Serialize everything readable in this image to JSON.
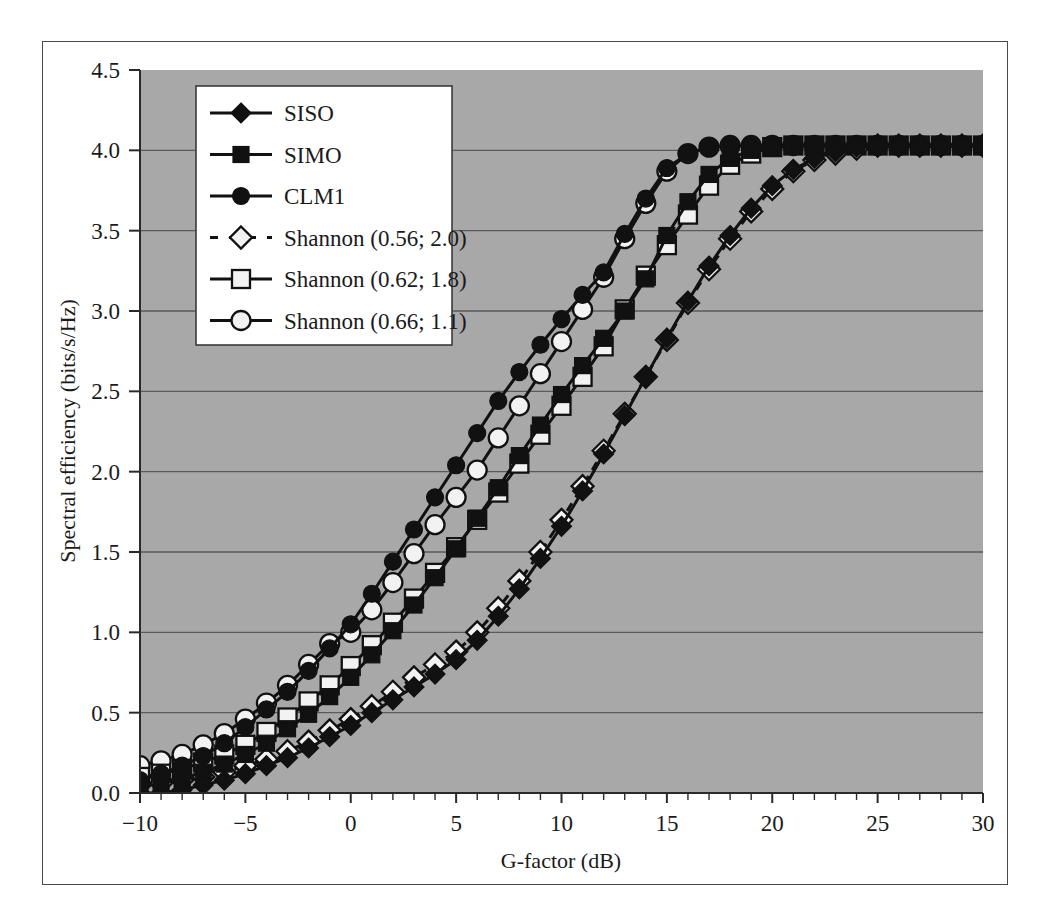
{
  "figure": {
    "background_color": "#ffffff",
    "frame_color": "#4a4a4a",
    "plot_background_color": "#a8a8a8",
    "grid_color": "#5a5a5a",
    "series_color": "#111111"
  },
  "chart_data": {
    "type": "line",
    "title": "",
    "xlabel": "G-factor (dB)",
    "ylabel": "Spectral efficiency (bits/s/Hz)",
    "xlim": [
      -10,
      30
    ],
    "ylim": [
      0.0,
      4.5
    ],
    "xticks": [
      -10,
      -5,
      0,
      5,
      10,
      15,
      20,
      25,
      30
    ],
    "xtick_labels": [
      "−10",
      "−5",
      "0",
      "5",
      "10",
      "15",
      "20",
      "25",
      "30"
    ],
    "xminor_tick_step": 1,
    "yticks": [
      0.0,
      0.5,
      1.0,
      1.5,
      2.0,
      2.5,
      3.0,
      3.5,
      4.0,
      4.5
    ],
    "ytick_labels": [
      "0.0",
      "0.5",
      "1.0",
      "1.5",
      "2.0",
      "2.5",
      "3.0",
      "3.5",
      "4.0",
      "4.5"
    ],
    "grid": "horizontal",
    "legend_position": "upper-left-inside",
    "x": [
      -10,
      -9,
      -8,
      -7,
      -6,
      -5,
      -4,
      -3,
      -2,
      -1,
      0,
      1,
      2,
      3,
      4,
      5,
      6,
      7,
      8,
      9,
      10,
      11,
      12,
      13,
      14,
      15,
      16,
      17,
      18,
      19,
      20,
      21,
      22,
      23,
      24,
      25,
      26,
      27,
      28,
      29,
      30
    ],
    "series": [
      {
        "name": "SISO",
        "marker": "filled-diamond",
        "linestyle": "solid",
        "values": [
          0.0,
          0.0,
          0.02,
          0.05,
          0.08,
          0.12,
          0.17,
          0.22,
          0.28,
          0.35,
          0.42,
          0.5,
          0.58,
          0.66,
          0.74,
          0.83,
          0.95,
          1.1,
          1.27,
          1.46,
          1.66,
          1.88,
          2.11,
          2.35,
          2.59,
          2.83,
          3.06,
          3.28,
          3.47,
          3.64,
          3.78,
          3.88,
          3.95,
          3.99,
          4.02,
          4.03,
          4.03,
          4.03,
          4.03,
          4.03,
          4.03
        ]
      },
      {
        "name": "SIMO",
        "marker": "filled-square",
        "linestyle": "solid",
        "values": [
          0.04,
          0.06,
          0.09,
          0.13,
          0.18,
          0.24,
          0.31,
          0.4,
          0.49,
          0.6,
          0.72,
          0.86,
          1.01,
          1.17,
          1.34,
          1.52,
          1.71,
          1.9,
          2.1,
          2.29,
          2.48,
          2.66,
          2.83,
          3.0,
          3.2,
          3.47,
          3.68,
          3.85,
          3.95,
          4.0,
          4.02,
          4.03,
          4.03,
          4.03,
          4.03,
          4.03,
          4.03,
          4.03,
          4.03,
          4.03,
          4.03
        ]
      },
      {
        "name": "CLM1",
        "marker": "filled-circle",
        "linestyle": "solid",
        "values": [
          0.08,
          0.12,
          0.17,
          0.23,
          0.31,
          0.41,
          0.52,
          0.63,
          0.76,
          0.9,
          1.05,
          1.24,
          1.44,
          1.64,
          1.84,
          2.04,
          2.24,
          2.44,
          2.62,
          2.79,
          2.95,
          3.1,
          3.24,
          3.48,
          3.7,
          3.89,
          3.98,
          4.02,
          4.03,
          4.03,
          4.03,
          4.03,
          4.03,
          4.03,
          4.03,
          4.03,
          4.03,
          4.03,
          4.03,
          4.03,
          4.03
        ]
      },
      {
        "name": "Shannon (0.56; 2.0)",
        "marker": "open-diamond",
        "linestyle": "dashed",
        "values": [
          0.05,
          0.06,
          0.08,
          0.1,
          0.13,
          0.17,
          0.21,
          0.26,
          0.32,
          0.39,
          0.46,
          0.54,
          0.63,
          0.72,
          0.8,
          0.88,
          1.0,
          1.15,
          1.32,
          1.5,
          1.7,
          1.91,
          2.13,
          2.36,
          2.59,
          2.82,
          3.05,
          3.26,
          3.45,
          3.62,
          3.76,
          3.87,
          3.94,
          3.98,
          4.01,
          4.03,
          4.03,
          4.03,
          4.03,
          4.03,
          4.03
        ]
      },
      {
        "name": "Shannon (0.62; 1.8)",
        "marker": "open-square",
        "linestyle": "solid",
        "values": [
          0.1,
          0.12,
          0.15,
          0.19,
          0.24,
          0.3,
          0.38,
          0.47,
          0.57,
          0.67,
          0.79,
          0.92,
          1.06,
          1.21,
          1.37,
          1.53,
          1.7,
          1.87,
          2.05,
          2.23,
          2.41,
          2.59,
          2.78,
          3.01,
          3.22,
          3.41,
          3.6,
          3.78,
          3.91,
          3.98,
          4.02,
          4.03,
          4.03,
          4.03,
          4.03,
          4.03,
          4.03,
          4.03,
          4.03,
          4.03,
          4.03
        ]
      },
      {
        "name": "Shannon (0.66; 1.1)",
        "marker": "open-circle",
        "linestyle": "solid",
        "values": [
          0.17,
          0.2,
          0.24,
          0.3,
          0.37,
          0.46,
          0.56,
          0.67,
          0.8,
          0.93,
          1.0,
          1.14,
          1.31,
          1.49,
          1.67,
          1.84,
          2.01,
          2.21,
          2.41,
          2.61,
          2.81,
          3.01,
          3.21,
          3.45,
          3.67,
          3.87,
          3.98,
          4.02,
          4.03,
          4.03,
          4.03,
          4.03,
          4.03,
          4.03,
          4.03,
          4.03,
          4.03,
          4.03,
          4.03,
          4.03,
          4.03
        ]
      }
    ]
  },
  "legend": {
    "entries": [
      {
        "label": "SISO",
        "marker": "filled-diamond",
        "linestyle": "solid"
      },
      {
        "label": "SIMO",
        "marker": "filled-square",
        "linestyle": "solid"
      },
      {
        "label": "CLM1",
        "marker": "filled-circle",
        "linestyle": "solid"
      },
      {
        "label": "Shannon (0.56; 2.0)",
        "marker": "open-diamond",
        "linestyle": "dashed"
      },
      {
        "label": "Shannon (0.62; 1.8)",
        "marker": "open-square",
        "linestyle": "solid"
      },
      {
        "label": "Shannon (0.66; 1.1)",
        "marker": "open-circle",
        "linestyle": "solid"
      }
    ]
  }
}
